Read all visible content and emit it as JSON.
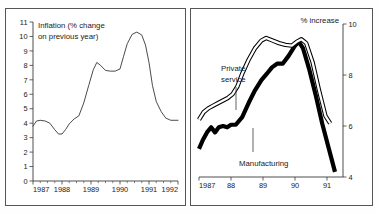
{
  "figure": {
    "background_color": "#ffffff",
    "border_color": "#555555"
  },
  "chart_data": [
    {
      "type": "line",
      "panel": "left",
      "title": "Inflation (% change",
      "title_line2": "on previous year)",
      "xlabel": "",
      "ylabel": "",
      "ylim": [
        0,
        11
      ],
      "xlim": [
        1987,
        1992
      ],
      "grid": false,
      "legend": "none",
      "ytick_labels": [
        "0",
        "1",
        "2",
        "3",
        "4",
        "5",
        "6",
        "7",
        "8",
        "9",
        "10",
        "11"
      ],
      "ytick_values": [
        0,
        1,
        2,
        3,
        4,
        5,
        6,
        7,
        8,
        9,
        10,
        11
      ],
      "xtick_labels": [
        "1987",
        "1988",
        "1989",
        "1990",
        "1991",
        "1992"
      ],
      "xtick_values": [
        1987,
        1988,
        1989,
        1990,
        1991,
        1992
      ],
      "series": [
        {
          "name": "Inflation",
          "style": "thin-line",
          "x": [
            1987.0,
            1987.12,
            1987.25,
            1987.42,
            1987.58,
            1987.75,
            1987.88,
            1988.0,
            1988.12,
            1988.25,
            1988.42,
            1988.58,
            1988.75,
            1988.92,
            1989.08,
            1989.2,
            1989.33,
            1989.5,
            1989.67,
            1989.83,
            1990.0,
            1990.12,
            1990.25,
            1990.42,
            1990.58,
            1990.75,
            1990.88,
            1991.0,
            1991.12,
            1991.25,
            1991.42,
            1991.58,
            1991.75,
            1992.0
          ],
          "y": [
            3.8,
            4.15,
            4.2,
            4.15,
            4.0,
            3.55,
            3.25,
            3.25,
            3.55,
            3.95,
            4.3,
            4.5,
            5.4,
            6.6,
            7.7,
            8.2,
            8.0,
            7.65,
            7.6,
            7.6,
            7.75,
            8.6,
            9.5,
            10.15,
            10.3,
            10.1,
            9.4,
            8.2,
            6.6,
            5.5,
            4.8,
            4.35,
            4.2,
            4.2
          ]
        }
      ]
    },
    {
      "type": "line",
      "panel": "right",
      "title": "% increase",
      "xlabel": "",
      "ylabel": "",
      "ylim": [
        4,
        10
      ],
      "xlim": [
        1987,
        1991.5
      ],
      "grid": false,
      "legend": "inline-annotations",
      "ytick_labels": [
        "4",
        "6",
        "8",
        "10"
      ],
      "ytick_values": [
        4,
        6,
        8,
        10
      ],
      "xtick_labels": [
        "1987",
        "88",
        "89",
        "90",
        "91"
      ],
      "xtick_values": [
        1987,
        1988,
        1989,
        1990,
        1991
      ],
      "series": [
        {
          "name": "Private service",
          "style": "outlined-thick-line",
          "x": [
            1987.0,
            1987.15,
            1987.3,
            1987.45,
            1987.6,
            1987.75,
            1987.9,
            1988.05,
            1988.2,
            1988.35,
            1988.55,
            1988.75,
            1988.95,
            1989.1,
            1989.3,
            1989.5,
            1989.7,
            1989.9,
            1990.05,
            1990.2,
            1990.35,
            1990.55,
            1990.75,
            1990.95,
            1991.1
          ],
          "y": [
            6.25,
            6.55,
            6.7,
            6.8,
            6.9,
            7.0,
            7.1,
            7.25,
            7.55,
            8.05,
            8.6,
            9.05,
            9.35,
            9.45,
            9.35,
            9.25,
            9.18,
            9.15,
            9.3,
            9.4,
            9.25,
            8.5,
            7.4,
            6.4,
            6.1
          ]
        },
        {
          "name": "Manufacturing",
          "style": "solid-thick-line",
          "x": [
            1987.0,
            1987.12,
            1987.25,
            1987.38,
            1987.5,
            1987.62,
            1987.75,
            1987.88,
            1988.0,
            1988.15,
            1988.35,
            1988.55,
            1988.75,
            1988.95,
            1989.12,
            1989.28,
            1989.45,
            1989.62,
            1989.8,
            1990.0,
            1990.12,
            1990.25,
            1990.45,
            1990.65,
            1990.85,
            1991.05,
            1991.25
          ],
          "y": [
            5.1,
            5.45,
            5.75,
            5.95,
            5.75,
            5.95,
            6.0,
            5.95,
            6.05,
            6.05,
            6.35,
            6.9,
            7.4,
            7.8,
            8.05,
            8.3,
            8.45,
            8.45,
            8.75,
            9.15,
            9.3,
            9.05,
            8.2,
            7.2,
            6.1,
            5.15,
            4.2
          ]
        }
      ],
      "annotations": [
        {
          "text": "Private",
          "x_px": 34,
          "y_px": 60
        },
        {
          "text": "service",
          "x_px": 34,
          "y_px": 71
        },
        {
          "text": "Manufacturing",
          "x_px": 56,
          "y_px": 156
        },
        {
          "text": "% increase",
          "x_px": 116,
          "y_px": 14
        }
      ]
    }
  ]
}
